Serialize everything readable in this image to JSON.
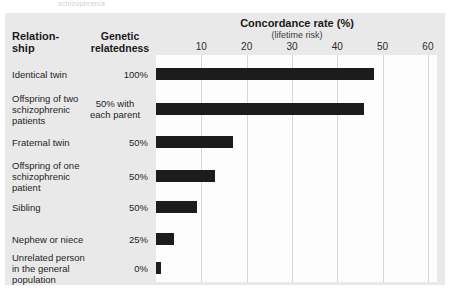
{
  "figure": {
    "top_sliver_text": "schizophrenia",
    "panel_color": "#e9e9e9",
    "plot_color": "#fdfdfd",
    "bar_color": "#1c1c1c",
    "grid_color": "#d6d6d6"
  },
  "headers": {
    "relationship": "Relation-\nship",
    "relationship_line1": "Relation-",
    "relationship_line2": "ship",
    "relatedness_line1": "Genetic",
    "relatedness_line2": "relatedness",
    "concordance_title": "Concordance rate (%)",
    "concordance_subtitle": "(lifetime risk)"
  },
  "chart_data": {
    "type": "bar",
    "orientation": "horizontal",
    "title": "Concordance rate (%)",
    "subtitle": "(lifetime risk)",
    "xlabel": "Concordance rate (%)",
    "ylabel": "Relationship",
    "xlim": [
      0,
      62
    ],
    "xticks": [
      10,
      20,
      30,
      40,
      50,
      60
    ],
    "grid": true,
    "legend": "none",
    "categories": [
      "Identical twin",
      "Offspring of two schizophrenic patients",
      "Fraternal twin",
      "Offspring of one schizophrenic patient",
      "Sibling",
      "Nephew or niece",
      "Unrelated person in the general population"
    ],
    "values": [
      48,
      46,
      17,
      13,
      9,
      4,
      1
    ],
    "genetic_relatedness": [
      "100%",
      "50% with each parent",
      "50%",
      "50%",
      "50%",
      "25%",
      "0%"
    ]
  },
  "rows": [
    {
      "label_lines": [
        "Identical twin"
      ],
      "label": "Identical twin",
      "relatedness": "100%",
      "relatedness_lines": [
        "100%"
      ],
      "value": 48
    },
    {
      "label_lines": [
        "Offspring of two",
        "schizophrenic",
        "patients"
      ],
      "label": "Offspring of two schizophrenic patients",
      "relatedness": "50% with each parent",
      "relatedness_lines": [
        "50% with",
        "each parent"
      ],
      "value": 46
    },
    {
      "label_lines": [
        "Fraternal twin"
      ],
      "label": "Fraternal twin",
      "relatedness": "50%",
      "relatedness_lines": [
        "50%"
      ],
      "value": 17
    },
    {
      "label_lines": [
        "Offspring of one",
        "schizophrenic",
        "patient"
      ],
      "label": "Offspring of one schizophrenic patient",
      "relatedness": "50%",
      "relatedness_lines": [
        "50%"
      ],
      "value": 13
    },
    {
      "label_lines": [
        "Sibling"
      ],
      "label": "Sibling",
      "relatedness": "50%",
      "relatedness_lines": [
        "50%"
      ],
      "value": 9
    },
    {
      "label_lines": [
        "Nephew or niece"
      ],
      "label": "Nephew or niece",
      "relatedness": "25%",
      "relatedness_lines": [
        "25%"
      ],
      "value": 4
    },
    {
      "label_lines": [
        "Unrelated person",
        "in the general",
        "population"
      ],
      "label": "Unrelated person in the general population",
      "relatedness": "0%",
      "relatedness_lines": [
        "0%"
      ],
      "value": 1
    }
  ]
}
